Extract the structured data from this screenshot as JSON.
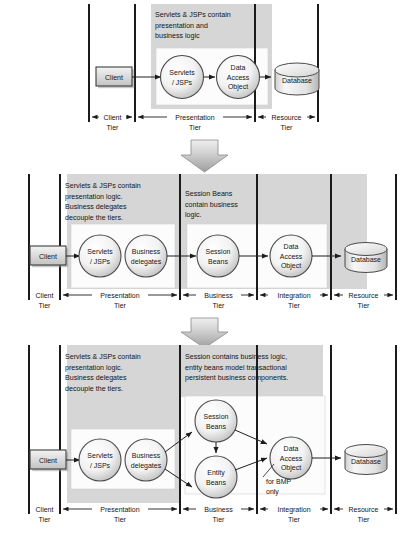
{
  "figure": {
    "colors": {
      "page_bg": "#ffffff",
      "panel_gray": "#d6d6d6",
      "inner_white": "#fcfcfc",
      "divider": "#1b1b1b",
      "stroke": "#3d3d3d",
      "text": "#151515",
      "node_light": "#fbfbfb",
      "node_dark": "#b6b6b6",
      "client_light": "#ededed",
      "client_dark": "#bdbdbd",
      "arrow_fill": "#cfcfcf"
    }
  },
  "diagrams": [
    {
      "id": "diagram-1",
      "name": "two-tier-presentation",
      "callouts": [
        {
          "name": "presentation-callout",
          "lines": [
            "Servlets & JSPs contain",
            "presentation and",
            "business logic"
          ]
        }
      ],
      "nodes": [
        {
          "name": "client",
          "shape": "box",
          "lines": [
            "Client"
          ]
        },
        {
          "name": "servlets-jsps",
          "shape": "circle",
          "lines": [
            "Servlets",
            "/ JSPs"
          ]
        },
        {
          "name": "data-access-object",
          "shape": "circle",
          "lines": [
            "Data",
            "Access",
            "Object"
          ]
        },
        {
          "name": "database",
          "shape": "cylinder",
          "lines": [
            "Database"
          ]
        }
      ],
      "tiers": [
        {
          "name": "client-tier",
          "lines": [
            "Client",
            "Tier"
          ]
        },
        {
          "name": "presentation-tier",
          "lines": [
            "Presentation",
            "Tier"
          ]
        },
        {
          "name": "resource-tier",
          "lines": [
            "Resource",
            "Tier"
          ]
        }
      ]
    },
    {
      "id": "diagram-2",
      "name": "session-bean-architecture",
      "callouts": [
        {
          "name": "presentation-callout",
          "lines": [
            "Servlets & JSPs contain",
            "presentation logic.",
            "Business delegates",
            "decouple the tiers."
          ]
        },
        {
          "name": "business-callout",
          "lines": [
            "Session Beans",
            "contain business",
            "logic."
          ]
        }
      ],
      "nodes": [
        {
          "name": "client",
          "shape": "box",
          "lines": [
            "Client"
          ]
        },
        {
          "name": "servlets-jsps",
          "shape": "circle",
          "lines": [
            "Servlets",
            "/ JSPs"
          ]
        },
        {
          "name": "business-delegates",
          "shape": "circle",
          "lines": [
            "Business",
            "delegates"
          ]
        },
        {
          "name": "session-beans",
          "shape": "circle",
          "lines": [
            "Session",
            "Beans"
          ]
        },
        {
          "name": "data-access-object",
          "shape": "circle",
          "lines": [
            "Data",
            "Access",
            "Object"
          ]
        },
        {
          "name": "database",
          "shape": "cylinder",
          "lines": [
            "Database"
          ]
        }
      ],
      "tiers": [
        {
          "name": "client-tier",
          "lines": [
            "Client",
            "Tier"
          ]
        },
        {
          "name": "presentation-tier",
          "lines": [
            "Presentation",
            "Tier"
          ]
        },
        {
          "name": "business-tier",
          "lines": [
            "Business",
            "Tier"
          ]
        },
        {
          "name": "integration-tier",
          "lines": [
            "Integration",
            "Tier"
          ]
        },
        {
          "name": "resource-tier",
          "lines": [
            "Resource",
            "Tier"
          ]
        }
      ]
    },
    {
      "id": "diagram-3",
      "name": "entity-bean-architecture",
      "callouts": [
        {
          "name": "presentation-callout",
          "lines": [
            "Servlets & JSPs contain",
            "presentation logic.",
            "Business delegates",
            "decouple the tiers."
          ]
        },
        {
          "name": "business-callout",
          "lines": [
            "Session contains business logic,",
            "entity beans model transactional",
            "persistent business components."
          ]
        }
      ],
      "nodes": [
        {
          "name": "client",
          "shape": "box",
          "lines": [
            "Client"
          ]
        },
        {
          "name": "servlets-jsps",
          "shape": "circle",
          "lines": [
            "Servlets",
            "/ JSPs"
          ]
        },
        {
          "name": "business-delegates",
          "shape": "circle",
          "lines": [
            "Business",
            "delegates"
          ]
        },
        {
          "name": "session-beans",
          "shape": "circle",
          "lines": [
            "Session",
            "Beans"
          ]
        },
        {
          "name": "entity-beans",
          "shape": "circle",
          "lines": [
            "Entity",
            "Beans"
          ]
        },
        {
          "name": "data-access-object",
          "shape": "circle",
          "lines": [
            "Data",
            "Access",
            "Object"
          ]
        },
        {
          "name": "database",
          "shape": "cylinder",
          "lines": [
            "Database"
          ]
        }
      ],
      "annotations": [
        {
          "name": "bmp-note",
          "lines": [
            "for BMP",
            "only"
          ]
        }
      ],
      "tiers": [
        {
          "name": "client-tier",
          "lines": [
            "Client",
            "Tier"
          ]
        },
        {
          "name": "presentation-tier",
          "lines": [
            "Presentation",
            "Tier"
          ]
        },
        {
          "name": "business-tier",
          "lines": [
            "Business",
            "Tier"
          ]
        },
        {
          "name": "integration-tier",
          "lines": [
            "Integration",
            "Tier"
          ]
        },
        {
          "name": "resource-tier",
          "lines": [
            "Resource",
            "Tier"
          ]
        }
      ]
    }
  ],
  "transitions": [
    {
      "name": "transition-arrow-1",
      "direction": "down"
    },
    {
      "name": "transition-arrow-2",
      "direction": "down"
    }
  ]
}
